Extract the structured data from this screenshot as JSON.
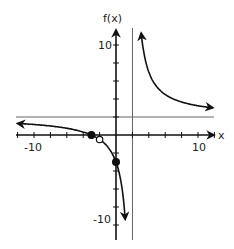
{
  "chart_data": {
    "type": "line",
    "title": "",
    "xlabel": "x",
    "ylabel": "f(x)",
    "xlim": [
      -12,
      12
    ],
    "ylim": [
      -12,
      12
    ],
    "x_tick_step": 2,
    "y_tick_step": 2,
    "x_tick_labels": [
      {
        "value": -10,
        "label": "-10"
      },
      {
        "value": 10,
        "label": "10"
      }
    ],
    "y_tick_labels": [
      {
        "value": 10,
        "label": "10"
      },
      {
        "value": -10,
        "label": "-10"
      }
    ],
    "grid": false,
    "function": "f(x) = 2 + 10/(x - 2)",
    "asymptotes": {
      "vertical": 2,
      "horizontal": 2
    },
    "series": [
      {
        "name": "left branch",
        "x": [
          -12,
          -10,
          -8,
          -6,
          -4,
          -3,
          -2,
          -1,
          0,
          0.5,
          1,
          1.3
        ],
        "y": [
          1.29,
          1.17,
          1.0,
          0.75,
          0.33,
          0,
          -0.5,
          -1.33,
          -3,
          -4.67,
          -8,
          -12.3
        ]
      },
      {
        "name": "right branch",
        "x": [
          2.8,
          3,
          4,
          5,
          6,
          8,
          10,
          12
        ],
        "y": [
          14.5,
          12,
          7,
          5.33,
          4.5,
          3.67,
          3.25,
          3.0
        ]
      }
    ],
    "points": [
      {
        "x": -3,
        "y": 0,
        "style": "filled",
        "label": "x-intercept"
      },
      {
        "x": 0,
        "y": -3,
        "style": "filled",
        "label": "y-intercept"
      },
      {
        "x": -2,
        "y": -0.5,
        "style": "open",
        "label": "hole"
      }
    ]
  },
  "labels": {
    "y_axis": "f(x)",
    "x_axis": "x",
    "x_neg10": "-10",
    "x_pos10": "10",
    "y_pos10": "10",
    "y_neg10": "-10"
  }
}
